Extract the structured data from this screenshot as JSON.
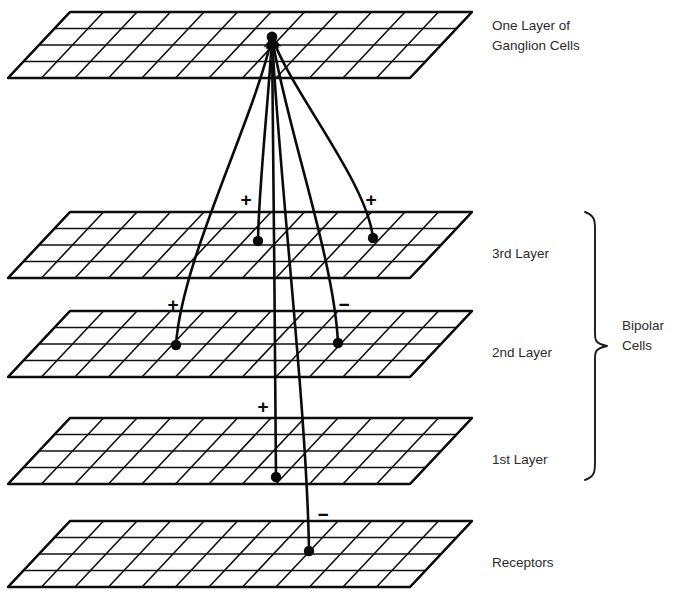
{
  "figure": {
    "background_color": "#ffffff",
    "ink_color": "#0b0b0b",
    "label_color": "#2b2b2b",
    "width": 684,
    "height": 599
  },
  "layers": [
    {
      "id": "ganglion",
      "label": "One Layer of\nGanglion Cells",
      "label_line1": "One Layer of",
      "label_line2": "Ganglion Cells",
      "label_x": 492,
      "label_y": 26,
      "plane": {
        "origin_x": 70,
        "origin_y": 12,
        "cols": 12,
        "rows": 4,
        "cell_w": 33.5,
        "cell_h": 16.5,
        "skew_x": -15.5
      }
    },
    {
      "id": "third",
      "label": "3rd Layer",
      "label_line1": "3rd Layer",
      "label_line2": "",
      "label_x": 492,
      "label_y": 254,
      "plane": {
        "origin_x": 70,
        "origin_y": 212,
        "cols": 12,
        "rows": 4,
        "cell_w": 33.5,
        "cell_h": 16.5,
        "skew_x": -15.5
      }
    },
    {
      "id": "second",
      "label": "2nd Layer",
      "label_line1": "2nd Layer",
      "label_line2": "",
      "label_x": 492,
      "label_y": 353,
      "plane": {
        "origin_x": 70,
        "origin_y": 311,
        "cols": 12,
        "rows": 4,
        "cell_w": 33.5,
        "cell_h": 16.5,
        "skew_x": -15.5
      }
    },
    {
      "id": "first",
      "label": "1st Layer",
      "label_line1": "1st Layer",
      "label_line2": "",
      "label_x": 492,
      "label_y": 460,
      "plane": {
        "origin_x": 70,
        "origin_y": 418,
        "cols": 12,
        "rows": 4,
        "cell_w": 33.5,
        "cell_h": 16.5,
        "skew_x": -15.5
      }
    },
    {
      "id": "receptors",
      "label": "Receptors",
      "label_line1": "Receptors",
      "label_line2": "",
      "label_x": 492,
      "label_y": 563,
      "plane": {
        "origin_x": 70,
        "origin_y": 521,
        "cols": 12,
        "rows": 4,
        "cell_w": 33.5,
        "cell_h": 16.5,
        "skew_x": -15.5
      }
    }
  ],
  "group_bracket": {
    "label_line1": "Bipolar",
    "label_line2": "Cells",
    "label_x": 622,
    "label_y_line1": 326,
    "label_y_line2": 346,
    "top_y": 212,
    "bottom_y": 480,
    "x": 596
  },
  "convergence_point": {
    "x": 272,
    "y": 37,
    "radius": 5.4
  },
  "cells": [
    {
      "id": "cell-3a",
      "layer": "third",
      "x": 258,
      "y": 241,
      "radius": 5.2
    },
    {
      "id": "cell-3b",
      "layer": "third",
      "x": 373,
      "y": 238,
      "radius": 5.2
    },
    {
      "id": "cell-2a",
      "layer": "second",
      "x": 176,
      "y": 345,
      "radius": 5.2
    },
    {
      "id": "cell-2b",
      "layer": "second",
      "x": 338,
      "y": 343,
      "radius": 5.2
    },
    {
      "id": "cell-1a",
      "layer": "first",
      "x": 276,
      "y": 477,
      "radius": 5.2
    },
    {
      "id": "cell-r1",
      "layer": "receptors",
      "x": 309,
      "y": 551,
      "radius": 5.2
    }
  ],
  "connections": [
    {
      "id": "conn-3a-ganglion",
      "from_cell": "cell-3a",
      "to": "convergence",
      "sign": "+",
      "sign_x": 246,
      "sign_y": 201,
      "arrow": true
    },
    {
      "id": "conn-3b-ganglion",
      "from_cell": "cell-3b",
      "to": "convergence",
      "sign": "+",
      "sign_x": 371,
      "sign_y": 201,
      "arrow": true
    },
    {
      "id": "conn-2a-ganglion",
      "from_cell": "cell-2a",
      "to": "convergence",
      "sign": "+",
      "sign_x": 173,
      "sign_y": 306,
      "arrow": true
    },
    {
      "id": "conn-2b-ganglion",
      "from_cell": "cell-2b",
      "to": "convergence",
      "sign": "−",
      "sign_x": 344,
      "sign_y": 306,
      "arrow": true
    },
    {
      "id": "conn-1a-ganglion",
      "from_cell": "cell-1a",
      "to": "convergence",
      "sign": "+",
      "sign_x": 263,
      "sign_y": 408,
      "arrow": true
    },
    {
      "id": "conn-r1-ganglion",
      "from_cell": "cell-r1",
      "to": "convergence",
      "sign": "−",
      "sign_x": 323,
      "sign_y": 516,
      "arrow": true
    }
  ],
  "sign_legend": {
    "plus": "+",
    "minus": "−"
  }
}
